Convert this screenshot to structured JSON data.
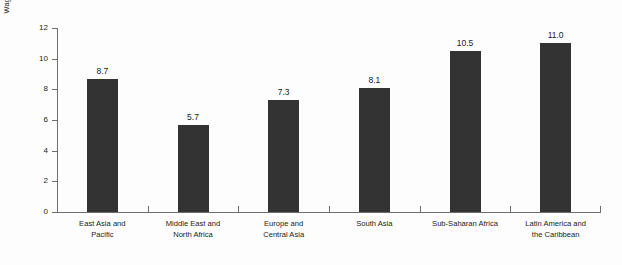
{
  "chart_data": {
    "type": "bar",
    "title": "",
    "xlabel": "",
    "ylabel": "Wage increase per additional year (%)",
    "ylim": [
      0,
      12
    ],
    "yticks": [
      0,
      2,
      4,
      6,
      8,
      10,
      12
    ],
    "ytick_labels": [
      "0",
      "2",
      "4",
      "6",
      "8",
      "10",
      "12"
    ],
    "grid": false,
    "legend": null,
    "categories": [
      "East Asia and\nPacific",
      "Middle East and\nNorth Africa",
      "Europe and\nCentral Asia",
      "South Asia",
      "Sub-Saharan Africa",
      "Latin America and\nthe Caribbean"
    ],
    "values": [
      8.7,
      5.7,
      7.3,
      8.1,
      10.5,
      11.0
    ],
    "value_labels": [
      "8.7",
      "5.7",
      "7.3",
      "8.1",
      "10.5",
      "11.0"
    ],
    "colors": {
      "bar": "#333333",
      "axis": "#6e6e6e",
      "text": "#1a1a1a",
      "background": "#fdfdfd"
    }
  }
}
